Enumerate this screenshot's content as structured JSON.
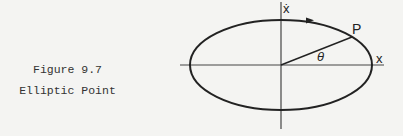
{
  "caption": {
    "figure_number": "Figure 9.7",
    "title": "Elliptic Point"
  },
  "diagram": {
    "type": "phase-plane",
    "axes": {
      "horizontal_label": "x",
      "vertical_label": "ẋ"
    },
    "curve": "ellipse",
    "point_label": "P",
    "angle_label": "θ",
    "direction": "clockwise",
    "colors": {
      "stroke": "#222222",
      "axis": "#444444",
      "background": "#f4f4f2"
    }
  }
}
